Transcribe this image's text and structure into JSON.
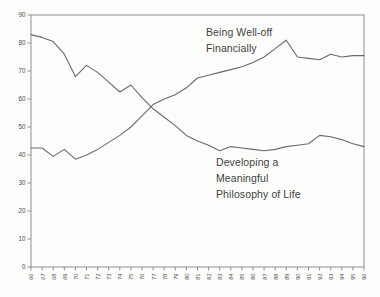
{
  "chart": {
    "background": "#fdfdfc",
    "box_color": "#8f8f8f",
    "line_color": "#6a6a6a",
    "tick_text_color": "#4a4a4a",
    "annotation_text_color": "#3f3f3f",
    "annotations": {
      "financial": "Being Well-off\nFinancially",
      "philosophy": "Developing a\nMeaningful\nPhilosophy of Life"
    }
  },
  "chart_data": {
    "type": "line",
    "title": "",
    "xlabel": "",
    "ylabel": "",
    "x_tick_labels": [
      "66",
      "67",
      "68",
      "69",
      "70",
      "71",
      "72",
      "73",
      "74",
      "75",
      "76",
      "77",
      "78",
      "79",
      "80",
      "81",
      "82",
      "83",
      "84",
      "85",
      "86",
      "87",
      "88",
      "89",
      "90",
      "91",
      "92",
      "93",
      "94",
      "95",
      "96"
    ],
    "x": [
      66,
      67,
      68,
      69,
      70,
      71,
      72,
      73,
      74,
      75,
      76,
      77,
      78,
      79,
      80,
      81,
      82,
      83,
      84,
      85,
      86,
      87,
      88,
      89,
      90,
      91,
      92,
      93,
      94,
      95,
      96
    ],
    "ylim": [
      0,
      90
    ],
    "yticks": [
      0,
      10,
      20,
      30,
      40,
      50,
      60,
      70,
      80,
      90
    ],
    "grid": false,
    "legend_position": "inline-annotations",
    "series": [
      {
        "name": "Being Well-off Financially",
        "slug": "financial",
        "values": [
          42.5,
          42.5,
          39.5,
          42,
          38.5,
          40,
          42,
          44.5,
          47,
          50,
          54,
          58,
          60,
          61.5,
          64,
          67.5,
          68.5,
          69.5,
          70.5,
          71.5,
          73,
          75,
          78,
          81,
          75,
          74.5,
          74,
          76,
          75,
          75.5,
          75.5
        ]
      },
      {
        "name": "Developing a Meaningful Philosophy of Life",
        "slug": "philosophy",
        "values": [
          83,
          82,
          80.5,
          76,
          68,
          72,
          69.5,
          66,
          62.5,
          65,
          60.5,
          56.5,
          53.5,
          50.5,
          47,
          45,
          43.5,
          41.5,
          43,
          42.5,
          42,
          41.5,
          42,
          43,
          43.5,
          44,
          47,
          46.5,
          45.5,
          44,
          43
        ]
      }
    ]
  }
}
